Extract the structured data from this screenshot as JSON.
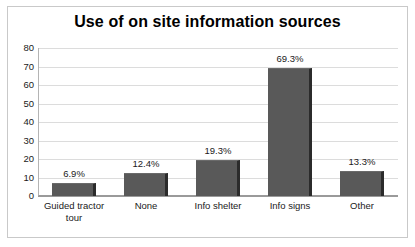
{
  "chart_data": {
    "type": "bar",
    "title": "Use of on site information sources",
    "xlabel": "",
    "ylabel": "",
    "categories": [
      "Guided tractor tour",
      "None",
      "Info shelter",
      "Info signs",
      "Other"
    ],
    "values": [
      6.9,
      12.4,
      19.3,
      69.3,
      13.3
    ],
    "data_labels": [
      "6.9%",
      "12.4%",
      "19.3%",
      "69.3%",
      "13.3%"
    ],
    "ylim": [
      0,
      80
    ],
    "ytick_step": 10,
    "ytick_labels": [
      "80",
      "70",
      "60",
      "50",
      "40",
      "30",
      "20",
      "10",
      "0"
    ],
    "ytick_values": [
      80,
      70,
      60,
      50,
      40,
      30,
      20,
      10,
      0
    ],
    "grid": "horizontal",
    "legend": "none",
    "series": [
      {
        "name": "Use of on site information sources",
        "values": [
          6.9,
          12.4,
          19.3,
          69.3,
          13.3
        ]
      }
    ],
    "colors": {
      "bar_fill": "#595959",
      "bar_shadow": "#2b2b2b",
      "gridline": "#dcdcdc",
      "axis": "#9a9a9a",
      "frame": "#c9c9c9",
      "text": "#1a1a1a",
      "title": "#000000",
      "background": "#ffffff"
    }
  },
  "category_lines": [
    [
      "Guided tractor",
      "tour"
    ],
    [
      "None"
    ],
    [
      "Info shelter"
    ],
    [
      "Info signs"
    ],
    [
      "Other"
    ]
  ]
}
